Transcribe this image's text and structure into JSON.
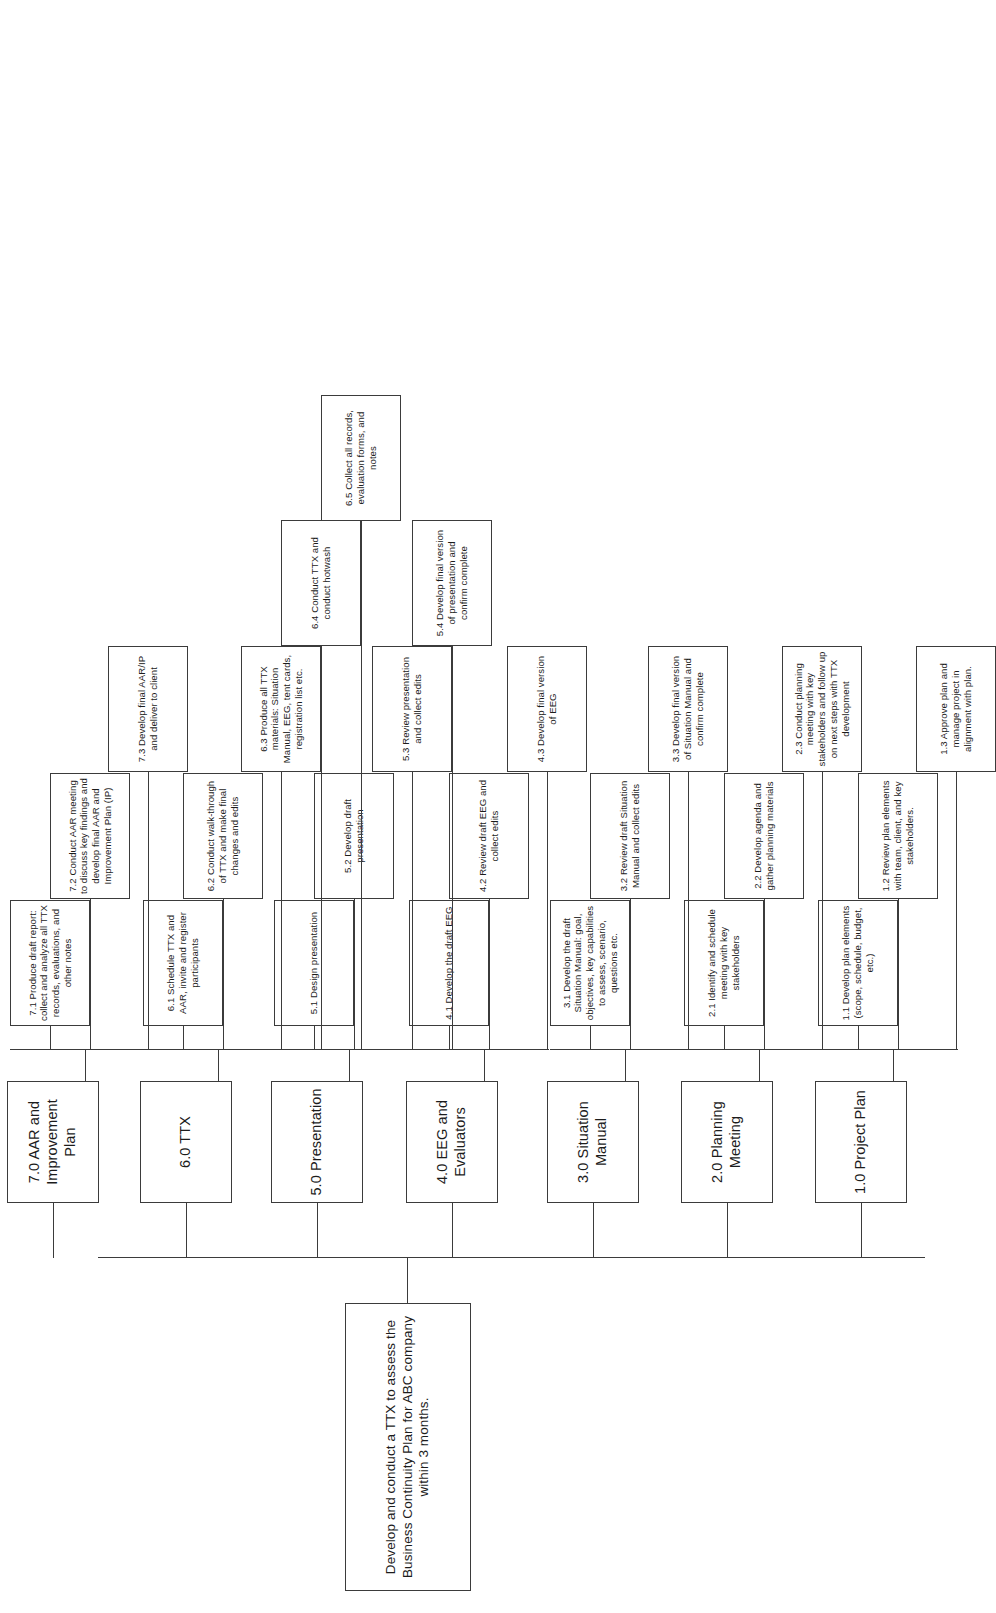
{
  "diagram": {
    "type": "work-breakdown-structure",
    "orientation": "rotated-90-ccw",
    "line_color": "#3b3b3b",
    "box_fill": "#ffffff",
    "root": {
      "id": "root",
      "label": "Develop and conduct a TTX to assess the Business Continuity Plan for ABC company within 3 months."
    },
    "phases": [
      {
        "id": "p1",
        "label": "1.0 Project Plan",
        "tasks": [
          {
            "id": "t1-1",
            "label": "1.1 Develop plan elements (scope, schedule, budget, etc.)"
          },
          {
            "id": "t1-2",
            "label": "1.2 Review plan elements with team, client, and key stakeholders."
          },
          {
            "id": "t1-3",
            "label": "1.3 Approve plan and manage project in alignment with plan."
          }
        ]
      },
      {
        "id": "p2",
        "label": "2.0 Planning Meeting",
        "tasks": [
          {
            "id": "t2-1",
            "label": "2.1 Identify and schedule meeting with key stakeholders"
          },
          {
            "id": "t2-2",
            "label": "2.2 Develop agenda and gather planning materials"
          },
          {
            "id": "t2-3",
            "label": "2.3 Conduct planning meeting with key stakeholders and follow up on next steps with TTX development"
          }
        ]
      },
      {
        "id": "p3",
        "label": "3.0 Situation Manual",
        "tasks": [
          {
            "id": "t3-1",
            "label": "3.1 Develop the draft Situation Manual: goal, objectives, key capabilities to assess, scenario, questions etc."
          },
          {
            "id": "t3-2",
            "label": "3.2 Review draft Situation Manual and collect edits"
          },
          {
            "id": "t3-3",
            "label": "3.3 Develop final version of Situation Manual and confirm complete"
          }
        ]
      },
      {
        "id": "p4",
        "label": "4.0 EEG and Evaluators",
        "tasks": [
          {
            "id": "t4-1",
            "label": "4.1 Develop the draft EEG"
          },
          {
            "id": "t4-2",
            "label": "4.2 Review draft EEG and collect edits"
          },
          {
            "id": "t4-3",
            "label": "4.3 Develop final version of EEG"
          }
        ]
      },
      {
        "id": "p5",
        "label": "5.0 Presentation",
        "tasks": [
          {
            "id": "t5-1",
            "label": "5.1 Design presentation"
          },
          {
            "id": "t5-2",
            "label": "5.2 Develop draft presentation"
          },
          {
            "id": "t5-3",
            "label": "5.3 Review presentation and collect edits"
          },
          {
            "id": "t5-4",
            "label": "5.4 Develop final version of presentation and confirm complete"
          }
        ]
      },
      {
        "id": "p6",
        "label": "6.0 TTX",
        "tasks": [
          {
            "id": "t6-1",
            "label": "6.1 Schedule TTX and AAR, invite and register participants"
          },
          {
            "id": "t6-2",
            "label": "6.2 Conduct walk-through of TTX and make final changes and edits"
          },
          {
            "id": "t6-3",
            "label": "6.3 Produce all TTX materials: Situation Manual, EEG, tent cards, registration list etc."
          },
          {
            "id": "t6-4",
            "label": "6.4 Conduct TTX and conduct hotwash"
          },
          {
            "id": "t6-5",
            "label": "6.5 Collect all records, evaluation forms, and notes"
          }
        ]
      },
      {
        "id": "p7",
        "label": "7.0 AAR and Improvement Plan",
        "tasks": [
          {
            "id": "t7-1",
            "label": "7.1 Produce draft report: collect and analyze all TTX records, evaluations, and other notes"
          },
          {
            "id": "t7-2",
            "label": "7.2 Conduct AAR meeting to discuss key findings and develop final AAR and Improvement Plan (IP)"
          },
          {
            "id": "t7-3",
            "label": "7.3 Develop final AAR/IP and deliver to client"
          }
        ]
      }
    ]
  }
}
